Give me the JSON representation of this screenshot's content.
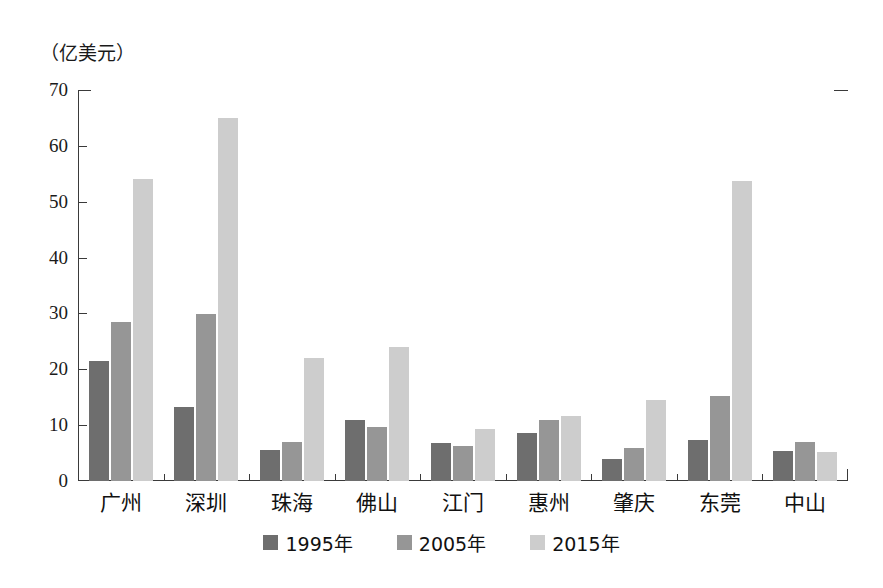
{
  "chart_data": {
    "type": "bar",
    "title": "",
    "subtitle": "",
    "xlabel": "",
    "ylabel": "（亿美元）",
    "unit_label": "（亿美元）",
    "ylim": [
      0,
      70
    ],
    "y_ticks": [
      0,
      10,
      20,
      30,
      40,
      50,
      60,
      70
    ],
    "grid": false,
    "legend_position": "bottom-center",
    "categories": [
      "广州",
      "深圳",
      "珠海",
      "佛山",
      "江门",
      "惠州",
      "肇庆",
      "东莞",
      "中山"
    ],
    "series": [
      {
        "name": "1995年",
        "color": "#6e6e6e",
        "values": [
          21.4,
          13.2,
          5.5,
          11.0,
          6.8,
          8.6,
          4.0,
          7.3,
          5.3
        ]
      },
      {
        "name": "2005年",
        "color": "#969696",
        "values": [
          28.5,
          29.9,
          7.0,
          9.7,
          6.3,
          11.0,
          6.0,
          15.2,
          7.0
        ]
      },
      {
        "name": "2015年",
        "color": "#cdcdcd",
        "values": [
          54.0,
          65.0,
          22.0,
          24.0,
          9.4,
          11.6,
          14.5,
          53.8,
          5.2
        ]
      }
    ]
  }
}
